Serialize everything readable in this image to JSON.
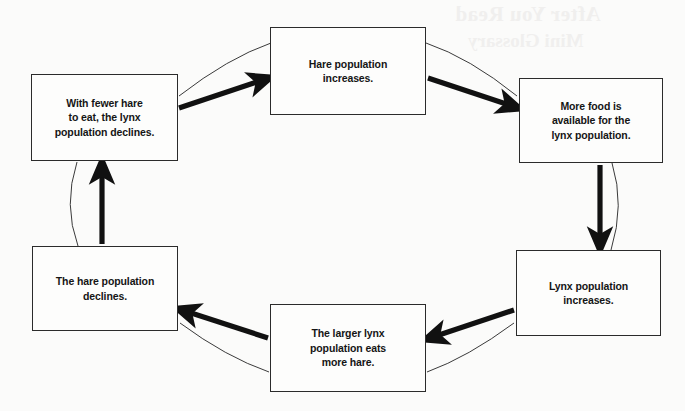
{
  "diagram": {
    "type": "cycle-flow-diagram",
    "background_color": "#fbfbfa",
    "box_border_color": "#2b2b2b",
    "arrow_color": "#111111",
    "guide_line_color": "#3a3a3a",
    "text_color": "#151515",
    "nodes": [
      {
        "id": "hare-increase",
        "label": "Hare population increases.",
        "lines": [
          "Hare population",
          "increases."
        ],
        "position": "top-center"
      },
      {
        "id": "more-food",
        "label": "More food is available for the lynx population.",
        "lines": [
          "More food is",
          "available for the",
          "lynx population."
        ],
        "position": "right-upper"
      },
      {
        "id": "lynx-increase",
        "label": "Lynx population increases.",
        "lines": [
          "Lynx population",
          "increases."
        ],
        "position": "right-lower"
      },
      {
        "id": "lynx-eats-hare",
        "label": "The larger lynx population eats more hare.",
        "lines": [
          "The larger lynx",
          "population eats",
          "more hare."
        ],
        "position": "bottom-center"
      },
      {
        "id": "hare-decline",
        "label": "The hare population declines.",
        "lines": [
          "The hare population",
          "declines."
        ],
        "position": "left-lower"
      },
      {
        "id": "lynx-decline",
        "label": "With fewer hare to eat, the lynx population declines.",
        "lines": [
          "With fewer hare",
          "to eat, the lynx",
          "population declines."
        ],
        "position": "left-upper"
      }
    ],
    "arrows": [
      {
        "id": "arrow-lynx-decline-to-hare-increase",
        "from": "lynx-decline",
        "to": "hare-increase",
        "direction": "up-right"
      },
      {
        "id": "arrow-hare-increase-to-more-food",
        "from": "hare-increase",
        "to": "more-food",
        "direction": "down-right"
      },
      {
        "id": "arrow-more-food-to-lynx-increase",
        "from": "more-food",
        "to": "lynx-increase",
        "direction": "down"
      },
      {
        "id": "arrow-lynx-increase-to-lynx-eats",
        "from": "lynx-increase",
        "to": "lynx-eats-hare",
        "direction": "down-left"
      },
      {
        "id": "arrow-lynx-eats-to-hare-decline",
        "from": "lynx-eats-hare",
        "to": "hare-decline",
        "direction": "up-left"
      },
      {
        "id": "arrow-hare-decline-to-lynx-decline",
        "from": "hare-decline",
        "to": "lynx-decline",
        "direction": "up"
      }
    ]
  },
  "page_bleedthrough": {
    "heading": "After You Read",
    "subheading": "Mini Glossary"
  }
}
